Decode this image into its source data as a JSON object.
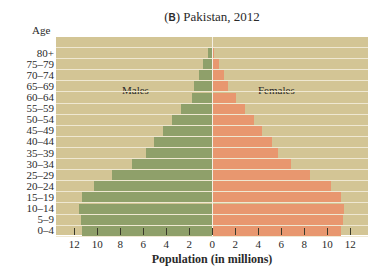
{
  "chart_data": {
    "type": "bar",
    "orientation": "horizontal-population-pyramid",
    "title": "(B) Pakistan, 2012",
    "title_prefix": "B",
    "title_text": "Pakistan, 2012",
    "ylabel": "Age",
    "xlabel": "Population (in millions)",
    "categories": [
      "80+",
      "75–79",
      "70–74",
      "65–69",
      "60–64",
      "55–59",
      "50–54",
      "45–49",
      "40–44",
      "35–39",
      "30–34",
      "25–29",
      "20–24",
      "15–19",
      "10–14",
      "5–9",
      "0–4"
    ],
    "series": [
      {
        "name": "Males",
        "color": "#8fa06a",
        "values": [
          0.4,
          0.8,
          1.2,
          1.6,
          1.8,
          2.7,
          3.5,
          4.3,
          5.1,
          5.8,
          7.0,
          8.7,
          10.3,
          11.3,
          11.6,
          11.4,
          11.3
        ]
      },
      {
        "name": "Females",
        "color": "#e8976f",
        "values": [
          0.1,
          0.5,
          0.9,
          1.3,
          2.0,
          2.8,
          3.5,
          4.2,
          5.1,
          5.6,
          6.8,
          8.4,
          10.2,
          11.1,
          11.4,
          11.3,
          11.1
        ]
      }
    ],
    "x_ticks": [
      12,
      10,
      8,
      6,
      4,
      2,
      0,
      2,
      4,
      6,
      8,
      10,
      12
    ],
    "xlim": [
      -13.5,
      13.5
    ],
    "grid": false,
    "legend_position": "inline-top",
    "background_color": "#d3c595"
  },
  "labels": {
    "title_prefix": "B",
    "title_text": "Pakistan, 2012",
    "age": "Age",
    "males": "Males",
    "females": "Females",
    "xlabel": "Population (in millions)"
  }
}
